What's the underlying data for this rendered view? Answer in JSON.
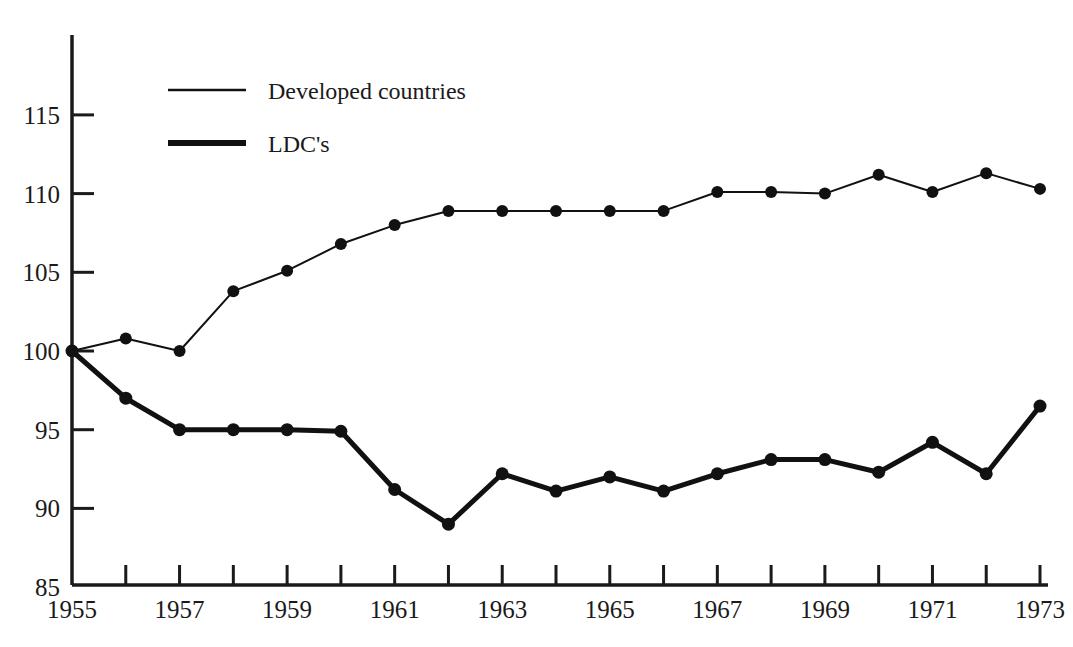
{
  "chart_data": {
    "type": "line",
    "title": "",
    "subtitle": "",
    "xlabel": "",
    "ylabel": "",
    "xlim": [
      1955,
      1973
    ],
    "ylim": [
      85,
      115
    ],
    "y_axis_extends_above_top_tick": true,
    "grid": false,
    "legend_position": "top-left-inside",
    "x": [
      1955,
      1956,
      1957,
      1958,
      1959,
      1960,
      1961,
      1962,
      1963,
      1964,
      1965,
      1966,
      1967,
      1968,
      1969,
      1970,
      1971,
      1972,
      1973
    ],
    "xticks": [
      1955,
      1956,
      1957,
      1958,
      1959,
      1960,
      1961,
      1962,
      1963,
      1964,
      1965,
      1966,
      1967,
      1968,
      1969,
      1970,
      1971,
      1972,
      1973
    ],
    "xticklabels": [
      "1955",
      "",
      "1957",
      "",
      "1959",
      "",
      "1961",
      "",
      "1963",
      "",
      "1965",
      "",
      "1967",
      "",
      "1969",
      "",
      "1971",
      "",
      "1973"
    ],
    "yticks": [
      85,
      90,
      95,
      100,
      105,
      110,
      115
    ],
    "yticklabels": [
      "85",
      "90",
      "95",
      "100",
      "105",
      "110",
      "115"
    ],
    "series": [
      {
        "name": "Developed countries",
        "style": "thin",
        "linewidth": 2,
        "marker": "filled-circle",
        "color": "#111111",
        "values": [
          100.0,
          100.8,
          100.0,
          103.8,
          105.1,
          106.8,
          108.0,
          108.9,
          108.9,
          108.9,
          108.9,
          108.9,
          110.1,
          110.1,
          110.0,
          111.2,
          110.1,
          111.3,
          110.3
        ]
      },
      {
        "name": "LDC's",
        "style": "thick",
        "linewidth": 5,
        "marker": "filled-circle",
        "color": "#111111",
        "values": [
          100.0,
          97.0,
          95.0,
          95.0,
          95.0,
          94.9,
          91.2,
          89.0,
          92.2,
          91.1,
          92.0,
          91.1,
          92.2,
          93.1,
          93.1,
          92.3,
          94.2,
          92.2,
          96.5
        ]
      }
    ],
    "legend": [
      {
        "label": "Developed countries",
        "style": "thin"
      },
      {
        "label": "LDC's",
        "style": "thick"
      }
    ]
  },
  "colors": {
    "ink": "#1a1a1a",
    "line": "#111111",
    "background": "#ffffff"
  }
}
